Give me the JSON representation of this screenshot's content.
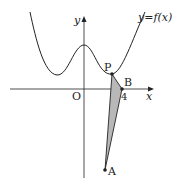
{
  "diagram": {
    "curve_label": "y=f(x)",
    "axis_x_label": "x",
    "axis_y_label": "y",
    "origin_label": "O",
    "tick_label_4": "4",
    "points": {
      "P": "P",
      "B": "B",
      "A": "A"
    },
    "colors": {
      "line": "#222222",
      "shade": "#b8b8b8"
    }
  }
}
